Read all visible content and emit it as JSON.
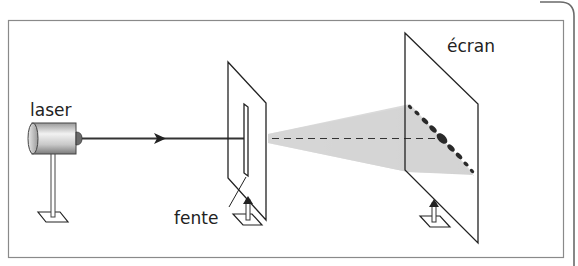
{
  "diagram": {
    "labels": {
      "laser": "laser",
      "slit": "fente",
      "screen": "écran"
    },
    "colors": {
      "line": "#222222",
      "frame": "#8a8a8a",
      "cone": "#d6d6d6",
      "spots": "#2a2a2a",
      "background": "#ffffff"
    },
    "components": [
      {
        "name": "laser",
        "label": "laser"
      },
      {
        "name": "slit-plate",
        "label": "fente"
      },
      {
        "name": "screen",
        "label": "écran"
      }
    ]
  }
}
